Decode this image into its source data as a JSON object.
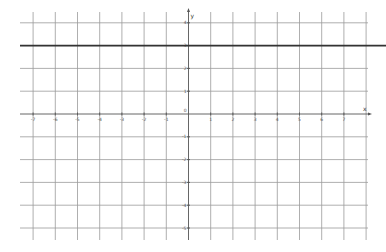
{
  "chart_data": {
    "type": "line",
    "title": "",
    "xlabel": "x",
    "ylabel": "y",
    "xlim": [
      -7.7,
      8.3
    ],
    "ylim": [
      -5.5,
      4.5
    ],
    "grid": true,
    "x_ticks": [
      -7,
      -6,
      -5,
      -4,
      -3,
      -2,
      -1,
      1,
      2,
      3,
      4,
      5,
      6,
      7
    ],
    "y_ticks": [
      4,
      3,
      2,
      1,
      -1,
      -2,
      -3,
      -4,
      -5
    ],
    "origin_label": "0",
    "series": [
      {
        "name": "y = 3",
        "equation": "y = 3",
        "x": [
          -7.7,
          8.9
        ],
        "y": [
          3,
          3
        ],
        "color": "#333333"
      }
    ]
  }
}
